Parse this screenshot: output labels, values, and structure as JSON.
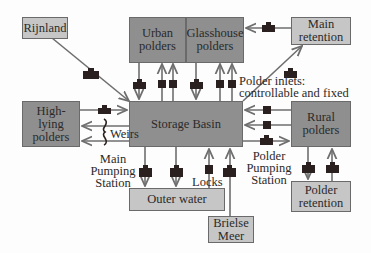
{
  "diagram": {
    "type": "water-system-flow-diagram",
    "colors": {
      "dark_box": "#8f8f8f",
      "light_box": "#c6c6c6",
      "line": "#6e6e6e",
      "structure": "#2b2020"
    },
    "nodes": {
      "rijnland": "Rijnland",
      "urban_polders": "Urban polders",
      "glasshouse_polders": "Glasshouse polders",
      "main_retention": "Main retention",
      "high_lying_polders": "High-lying polders",
      "storage_basin": "Storage Basin",
      "rural_polders": "Rural polders",
      "outer_water": "Outer water",
      "polder_retention": "Polder retention",
      "brielse_meer": "Brielse Meer"
    },
    "labels": {
      "polder_inlets": "Polder inlets:",
      "polder_inlets_2": "controllable and fixed",
      "weirs": "Weirs",
      "main_pumping_1": "Main",
      "main_pumping_2": "Pumping",
      "main_pumping_3": "Station",
      "polder_pumping_1": "Polder",
      "polder_pumping_2": "Pumping",
      "polder_pumping_3": "Station",
      "locks": "Locks"
    },
    "edges": [
      {
        "from": "Rijnland",
        "to": "Storage Basin",
        "structure": "pump"
      },
      {
        "from": "Urban polders",
        "to": "Storage Basin",
        "structure": "pump"
      },
      {
        "from": "Storage Basin",
        "to": "Urban polders",
        "structure": "inlet",
        "count": 2
      },
      {
        "from": "Glasshouse polders",
        "to": "Storage Basin",
        "structure": "pump"
      },
      {
        "from": "Storage Basin",
        "to": "Glasshouse polders",
        "structure": "inlet",
        "count": 2
      },
      {
        "from": "Main retention",
        "to": "Glasshouse polders",
        "structure": "pump"
      },
      {
        "from": "Storage Basin",
        "to": "Main retention",
        "structure": "pump"
      },
      {
        "from": "High-lying polders",
        "to": "Storage Basin",
        "structure": "pump"
      },
      {
        "from": "Storage Basin",
        "to": "High-lying polders",
        "structure": "weir",
        "count": 2
      },
      {
        "from": "Rural polders",
        "to": "Storage Basin",
        "structure": "inlet",
        "count": 2
      },
      {
        "from": "Storage Basin",
        "to": "Rural polders",
        "structure": "pump"
      },
      {
        "from": "Storage Basin",
        "to": "Outer water",
        "structure": "pump",
        "count": 2
      },
      {
        "from": "Outer water",
        "to": "Storage Basin",
        "structure": "lock"
      },
      {
        "from": "Brielse Meer",
        "to": "Storage Basin",
        "structure": "pump"
      },
      {
        "from": "Rural polders",
        "to": "Polder retention",
        "structure": "pump"
      },
      {
        "from": "Polder retention",
        "to": "Rural polders",
        "structure": "pump"
      }
    ]
  }
}
